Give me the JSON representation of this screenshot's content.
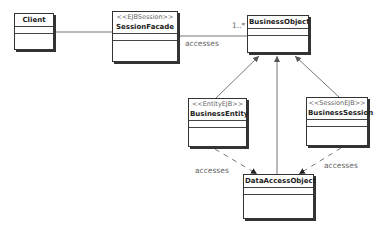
{
  "diagram": {
    "type": "UML class diagram",
    "classes": {
      "client": {
        "stereotype": "",
        "name": "Client"
      },
      "session_facade": {
        "stereotype": "<<EJBSession>>",
        "name": "SessionFacade"
      },
      "business_object": {
        "stereotype": "",
        "name": "BusinessObject"
      },
      "business_entity": {
        "stereotype": "<<EntityEJB>>",
        "name": "BusinessEntity"
      },
      "business_session": {
        "stereotype": "<<SessionEJB>>",
        "name": "BusinessSession"
      },
      "data_access_object": {
        "stereotype": "",
        "name": "DataAccessObject"
      }
    },
    "relationships": {
      "client_facade": {
        "from": "Client",
        "to": "SessionFacade",
        "kind": "association"
      },
      "facade_bo": {
        "from": "SessionFacade",
        "to": "BusinessObject",
        "kind": "association",
        "label": "accesses",
        "multiplicity": "1..*"
      },
      "entity_bo": {
        "from": "BusinessEntity",
        "to": "BusinessObject",
        "kind": "generalization"
      },
      "dao_bo": {
        "from": "DataAccessObject",
        "to": "BusinessObject",
        "kind": "generalization"
      },
      "session_bo": {
        "from": "BusinessSession",
        "to": "BusinessObject",
        "kind": "generalization"
      },
      "entity_dao": {
        "from": "BusinessEntity",
        "to": "DataAccessObject",
        "kind": "dependency",
        "label": "accesses"
      },
      "session_dao": {
        "from": "BusinessSession",
        "to": "DataAccessObject",
        "kind": "dependency",
        "label": "accesses"
      }
    }
  }
}
